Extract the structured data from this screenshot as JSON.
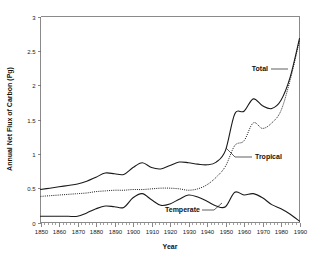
{
  "chart_data": {
    "type": "line",
    "title": "",
    "xlabel": "Year",
    "ylabel": "Annual Net Flux of Carbon (Pg)",
    "xlim": [
      1850,
      1990
    ],
    "ylim": [
      0,
      3
    ],
    "xticks": [
      1850,
      1860,
      1870,
      1880,
      1890,
      1900,
      1910,
      1920,
      1930,
      1940,
      1950,
      1960,
      1970,
      1980,
      1990
    ],
    "yticks": [
      0,
      0.5,
      1,
      1.5,
      2,
      2.5,
      3
    ],
    "grid": false,
    "legend_position": "inline-annotations",
    "annotations": [
      {
        "text": "Total",
        "x": 1977,
        "y": 2.15,
        "series": "Total"
      },
      {
        "text": "Tropical",
        "x": 1972,
        "y": 0.95,
        "series": "Tropical"
      },
      {
        "text": "Temperate",
        "x": 1929,
        "y": 0.17,
        "series": "Temperate"
      }
    ],
    "x": [
      1850,
      1855,
      1860,
      1865,
      1870,
      1875,
      1880,
      1885,
      1890,
      1895,
      1900,
      1905,
      1910,
      1915,
      1920,
      1925,
      1930,
      1935,
      1940,
      1945,
      1950,
      1955,
      1960,
      1965,
      1970,
      1975,
      1980,
      1985,
      1990
    ],
    "series": [
      {
        "name": "Total",
        "style": "solid",
        "values": [
          0.48,
          0.5,
          0.52,
          0.54,
          0.56,
          0.6,
          0.66,
          0.72,
          0.71,
          0.7,
          0.8,
          0.87,
          0.8,
          0.78,
          0.83,
          0.88,
          0.87,
          0.85,
          0.84,
          0.88,
          1.05,
          1.58,
          1.62,
          1.8,
          1.7,
          1.66,
          1.78,
          2.12,
          2.68
        ]
      },
      {
        "name": "Tropical",
        "style": "dotted",
        "values": [
          0.38,
          0.39,
          0.4,
          0.41,
          0.42,
          0.43,
          0.45,
          0.46,
          0.47,
          0.47,
          0.48,
          0.48,
          0.49,
          0.5,
          0.5,
          0.49,
          0.47,
          0.49,
          0.55,
          0.66,
          0.82,
          1.12,
          1.19,
          1.45,
          1.37,
          1.45,
          1.63,
          2.08,
          2.65
        ]
      },
      {
        "name": "Temperate",
        "style": "solid",
        "values": [
          0.09,
          0.09,
          0.09,
          0.09,
          0.09,
          0.14,
          0.2,
          0.24,
          0.23,
          0.22,
          0.36,
          0.42,
          0.33,
          0.25,
          0.27,
          0.34,
          0.4,
          0.37,
          0.31,
          0.24,
          0.23,
          0.44,
          0.4,
          0.42,
          0.36,
          0.26,
          0.2,
          0.12,
          0.02
        ]
      }
    ]
  }
}
